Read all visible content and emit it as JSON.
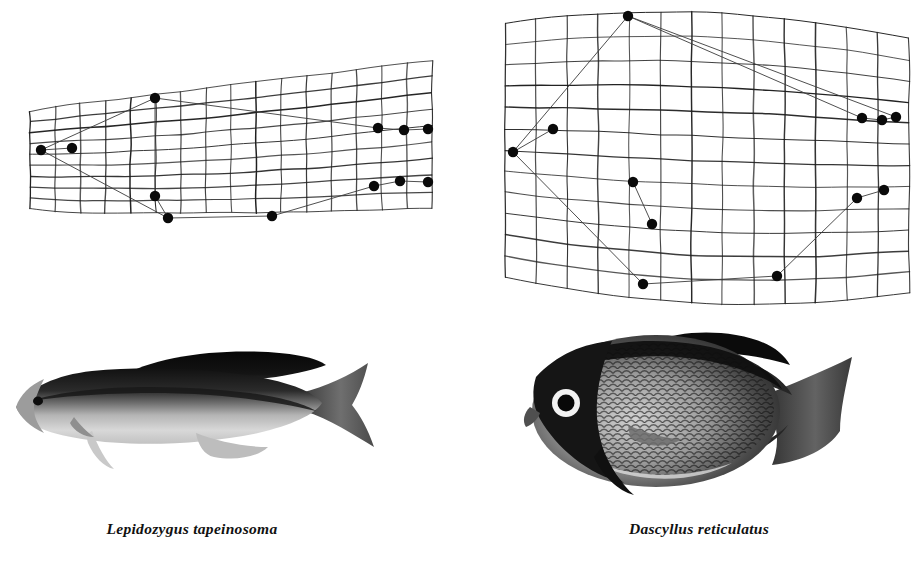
{
  "figure": {
    "background_color": "#ffffff",
    "ink_color": "#1a1a1a",
    "type": "thin-plate-spline-deformation-grid-comparison"
  },
  "panels": [
    {
      "id": "left",
      "species_caption": "Lepidozygus tapeinosoma",
      "grid_label": "deformation-grid-lepidozygus",
      "photo_label": "photograph-lepidozygus-tapeinosoma",
      "body_form": "elongate fusiform",
      "grid": {
        "columns": 16,
        "rows": 9,
        "bounds": {
          "x": 30,
          "y": 86,
          "width": 402,
          "height": 148
        },
        "shape_note": "narrow wedge, compressed vertically, tapering anteriorly"
      },
      "landmarks": [
        {
          "name": "snout-tip",
          "x": 41,
          "y": 150
        },
        {
          "name": "eye-region",
          "x": 72,
          "y": 148
        },
        {
          "name": "dorsal-fin-origin",
          "x": 155,
          "y": 98
        },
        {
          "name": "pectoral-fin-base",
          "x": 155,
          "y": 196
        },
        {
          "name": "pelvic-fin-origin",
          "x": 168,
          "y": 218
        },
        {
          "name": "anal-fin-origin",
          "x": 272,
          "y": 216
        },
        {
          "name": "dorsal-fin-terminus",
          "x": 378,
          "y": 128
        },
        {
          "name": "upper-caudal-peduncle",
          "x": 404,
          "y": 130
        },
        {
          "name": "upper-caudal-tip",
          "x": 428,
          "y": 129
        },
        {
          "name": "anal-fin-terminus",
          "x": 374,
          "y": 186
        },
        {
          "name": "lower-caudal-peduncle",
          "x": 400,
          "y": 181
        },
        {
          "name": "lower-caudal-tip",
          "x": 428,
          "y": 182
        }
      ],
      "wireframe_edges": [
        [
          0,
          2
        ],
        [
          0,
          4
        ],
        [
          0,
          1
        ],
        [
          2,
          6
        ],
        [
          3,
          4
        ],
        [
          3,
          2
        ],
        [
          4,
          5
        ],
        [
          5,
          9
        ],
        [
          6,
          7
        ],
        [
          7,
          8
        ],
        [
          9,
          10
        ],
        [
          10,
          11
        ]
      ]
    },
    {
      "id": "right",
      "species_caption": "Dascyllus reticulatus",
      "grid_label": "deformation-grid-dascyllus",
      "photo_label": "photograph-dascyllus-reticulatus",
      "body_form": "deep disc-shaped",
      "grid": {
        "columns": 13,
        "rows": 12,
        "bounds": {
          "x": 505,
          "y": 10,
          "width": 404,
          "height": 280
        },
        "shape_note": "tall expanded quadrilateral, strongly deepened body region"
      },
      "landmarks": [
        {
          "name": "snout-tip",
          "x": 513,
          "y": 152
        },
        {
          "name": "eye-region",
          "x": 553,
          "y": 129
        },
        {
          "name": "dorsal-fin-origin",
          "x": 628,
          "y": 16
        },
        {
          "name": "pectoral-fin-base",
          "x": 633,
          "y": 182
        },
        {
          "name": "pelvic-fin-origin",
          "x": 652,
          "y": 224
        },
        {
          "name": "anal-fin-origin",
          "x": 643,
          "y": 284
        },
        {
          "name": "dorsal-fin-terminus",
          "x": 862,
          "y": 118
        },
        {
          "name": "upper-caudal-peduncle",
          "x": 882,
          "y": 120
        },
        {
          "name": "upper-caudal-tip",
          "x": 896,
          "y": 117
        },
        {
          "name": "anal-fin-terminus",
          "x": 777,
          "y": 276
        },
        {
          "name": "lower-caudal-peduncle",
          "x": 857,
          "y": 198
        },
        {
          "name": "lower-caudal-tip",
          "x": 884,
          "y": 190
        }
      ],
      "wireframe_edges": [
        [
          0,
          2
        ],
        [
          0,
          5
        ],
        [
          0,
          1
        ],
        [
          2,
          6
        ],
        [
          2,
          8
        ],
        [
          3,
          4
        ],
        [
          5,
          9
        ],
        [
          9,
          10
        ],
        [
          10,
          11
        ],
        [
          6,
          7
        ],
        [
          7,
          8
        ]
      ]
    }
  ]
}
